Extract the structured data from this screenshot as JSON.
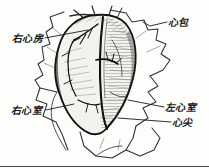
{
  "figure": {
    "kind": "anatomical-line-drawing",
    "view": "anterior",
    "background_color": "#fdfdfc",
    "ink_color": "#1b1b1b",
    "border": {
      "present": true,
      "edges": [
        "bottom"
      ],
      "color": "#4a4a4a"
    }
  },
  "labels": [
    {
      "id": "right-atrium",
      "text": "右心房",
      "position": "top-left",
      "leader": "horizontal-right-to-upper-heart"
    },
    {
      "id": "pericardium",
      "text": "心包",
      "position": "top-right",
      "leader": "horizontal-left-to-pericardial-flap"
    },
    {
      "id": "right-ventricle",
      "text": "右心室",
      "position": "bottom-left",
      "leader": "horizontal-right-to-lower-left-heart"
    },
    {
      "id": "left-ventricle",
      "text": "左心室",
      "position": "bottom-right",
      "leader": "horizontal-left-to-lower-right-heart"
    },
    {
      "id": "cardiac-apex",
      "text": "心尖",
      "position": "bottom-right-lower",
      "leader": "horizontal-left-to-apex"
    }
  ],
  "structures": {
    "heart": {
      "name": "heart",
      "outline": "ovoid, vertically elongated, tapering to apex at bottom",
      "shading": "dense cross-hatch on left margin, fine horizontal striations on right",
      "features": [
        "anterior interventricular sulcus as dark vertical groove",
        "branching coronary vessels on upper-left surface",
        "rounded base at top with great-vessel stumps"
      ]
    },
    "pericardium": {
      "name": "pericardium",
      "description": "opened sac, angular cut flaps reflected outward on both sides and below"
    }
  }
}
